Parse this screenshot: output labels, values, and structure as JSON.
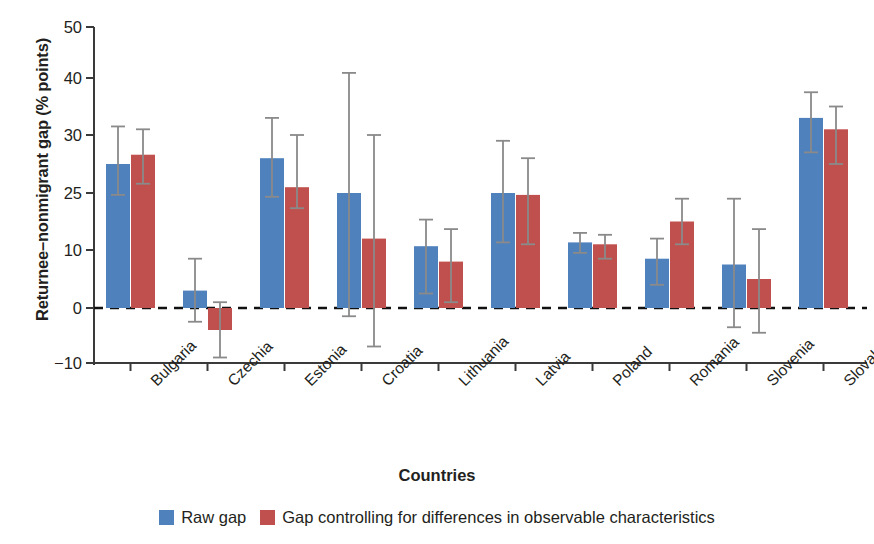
{
  "chart_data": {
    "type": "bar",
    "title": "",
    "xlabel": "Countries",
    "ylabel": "Returnee–nonmigrant gap (% points)",
    "categories": [
      "Bulgaria",
      "Czechia",
      "Estonia",
      "Croatia",
      "Lithuania",
      "Latvia",
      "Poland",
      "Romania",
      "Slovenia",
      "Slovakia"
    ],
    "ytick_labels": [
      "50",
      "40",
      "30",
      "25",
      "10",
      "0",
      "−10"
    ],
    "ytick_values": [
      50,
      40,
      30,
      25,
      10,
      0,
      -10
    ],
    "axis_note": "y-axis tick labels are evenly spaced in the figure although the values are non-uniform",
    "grid": false,
    "legend_position": "bottom-center",
    "zero_line": 0,
    "series": [
      {
        "name": "Raw gap",
        "color": "#4f81bd",
        "values": [
          27.5,
          3.0,
          28.0,
          25.0,
          11.0,
          25.0,
          12.0,
          8.5,
          7.5,
          33.0
        ],
        "err_low": [
          24.5,
          -2.5,
          24.0,
          -1.5,
          2.5,
          12.0,
          9.5,
          4.0,
          -3.5,
          28.5
        ],
        "err_high": [
          31.5,
          8.5,
          33.0,
          41.0,
          18.0,
          29.5,
          14.5,
          13.0,
          23.5,
          37.5
        ]
      },
      {
        "name": "Gap controlling for differences in observable characteristics",
        "color": "#c0504d",
        "values": [
          28.3,
          -4.0,
          25.5,
          13.0,
          8.0,
          24.5,
          11.5,
          17.5,
          5.0,
          31.0
        ],
        "err_low": [
          25.8,
          -9.0,
          21.0,
          -7.0,
          1.0,
          11.5,
          8.5,
          11.5,
          -4.5,
          27.5
        ],
        "err_high": [
          31.0,
          1.0,
          30.0,
          30.0,
          15.5,
          28.0,
          14.0,
          23.5,
          15.5,
          35.0
        ]
      }
    ]
  },
  "legend": {
    "entries": [
      {
        "label": "Raw gap",
        "color": "#4f81bd"
      },
      {
        "label": "Gap controlling for differences in observable characteristics",
        "color": "#c0504d"
      }
    ]
  },
  "axes": {
    "y_title": "Returnee–nonmigrant gap (% points)",
    "x_title": "Countries"
  }
}
